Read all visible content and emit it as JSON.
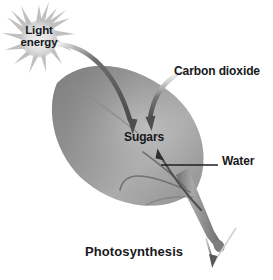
{
  "figure": {
    "title": "Photosynthesis",
    "background_color": "#ffffff",
    "text_color": "#17181a"
  },
  "labels": {
    "light_energy": "Light\nenergy",
    "light_energy_line1": "Light",
    "light_energy_line2": "energy",
    "carbon_dioxide": "Carbon dioxide",
    "sugars": "Sugars",
    "water": "Water",
    "caption": "Photosynthesis"
  },
  "elements": {
    "sun": {
      "name": "sun-burst-icon",
      "label": "Light energy",
      "center_color": "#e3e3e3",
      "ray_color": "#b9b9b9"
    },
    "leaf": {
      "name": "leaf-shape",
      "edge_color": "#7f7f7f",
      "mid_color": "#9a9a9a",
      "highlight_color": "#b6b6b6"
    },
    "stem": {
      "name": "leaf-stem",
      "color": "#8c8c8c"
    },
    "arrows": [
      {
        "name": "light-energy-arrow",
        "from": "Light energy",
        "to": "Sugars",
        "direction": "down-right",
        "color": "#58585a"
      },
      {
        "name": "carbon-dioxide-arrow",
        "from": "Carbon dioxide",
        "to": "Sugars",
        "direction": "down-left",
        "color": "#58585a"
      },
      {
        "name": "water-uptake-arrow",
        "from": "Water",
        "to": "Sugars",
        "direction": "up-left",
        "color": "#4f4f52"
      },
      {
        "name": "root-water-arrow",
        "from": "stem base",
        "to": "soil",
        "direction": "down",
        "color": "#58585a"
      }
    ],
    "leader_lines": [
      {
        "name": "water-leader-line",
        "label": "Water",
        "color": "#1f1f21"
      }
    ]
  }
}
